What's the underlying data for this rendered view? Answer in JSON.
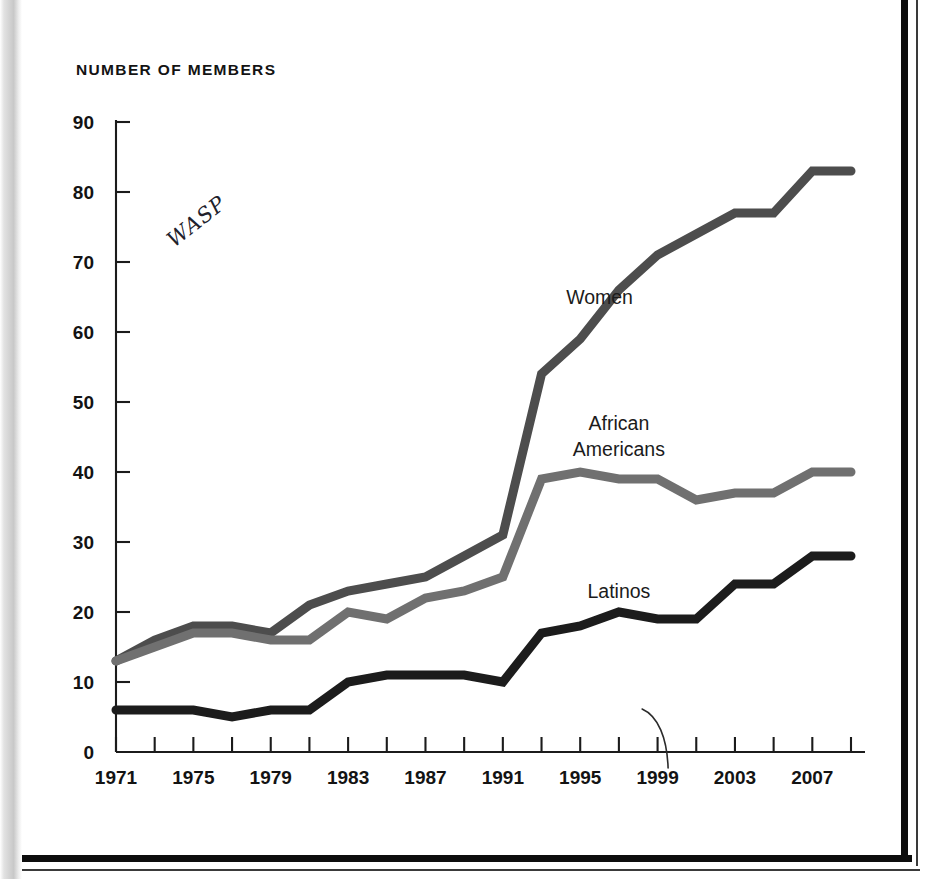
{
  "chart_data": {
    "type": "line",
    "title": "NUMBER OF MEMBERS",
    "xlabel": "",
    "ylabel": "",
    "xlim": [
      1971,
      2009
    ],
    "ylim": [
      0,
      90
    ],
    "grid": false,
    "legend_position": "inline-labels",
    "y_ticks": [
      0,
      10,
      20,
      30,
      40,
      50,
      60,
      70,
      80,
      90
    ],
    "y_tick_labels": [
      "0",
      "10",
      "20",
      "30",
      "40",
      "50",
      "60",
      "70",
      "80",
      "90"
    ],
    "x_ticks": [
      1971,
      1973,
      1975,
      1977,
      1979,
      1981,
      1983,
      1985,
      1987,
      1989,
      1991,
      1993,
      1995,
      1997,
      1999,
      2001,
      2003,
      2005,
      2007,
      2009
    ],
    "x_tick_labels_shown": [
      "1971",
      "1975",
      "1979",
      "1983",
      "1987",
      "1991",
      "1995",
      "1999",
      "2003",
      "2007"
    ],
    "x_labeled_years": [
      1971,
      1975,
      1979,
      1983,
      1987,
      1991,
      1995,
      1999,
      2003,
      2007
    ],
    "x": [
      1971,
      1973,
      1975,
      1977,
      1979,
      1981,
      1983,
      1985,
      1987,
      1989,
      1991,
      1993,
      1995,
      1997,
      1999,
      2001,
      2003,
      2005,
      2007,
      2009
    ],
    "series": [
      {
        "name": "Women",
        "color": "#4d4d4d",
        "stroke_width": 9,
        "values": [
          13,
          16,
          18,
          18,
          17,
          21,
          23,
          24,
          25,
          28,
          31,
          54,
          59,
          66,
          71,
          74,
          77,
          77,
          83,
          83
        ]
      },
      {
        "name": "African Americans",
        "color": "#707070",
        "stroke_width": 9,
        "values": [
          13,
          15,
          17,
          17,
          16,
          16,
          20,
          19,
          22,
          23,
          25,
          39,
          40,
          39,
          39,
          36,
          37,
          37,
          40,
          40
        ]
      },
      {
        "name": "Latinos",
        "color": "#1c1c1c",
        "stroke_width": 9,
        "values": [
          6,
          6,
          6,
          5,
          6,
          6,
          10,
          11,
          11,
          11,
          10,
          17,
          18,
          20,
          19,
          19,
          24,
          24,
          28,
          28
        ]
      }
    ],
    "annotations": [
      {
        "text": "Women",
        "x": 1996,
        "y": 64,
        "kind": "series-label"
      },
      {
        "text": "African\nAmericans",
        "x": 1997,
        "y": 46,
        "kind": "series-label"
      },
      {
        "text": "Latinos",
        "x": 1997,
        "y": 22,
        "kind": "series-label"
      },
      {
        "text": "WASP",
        "kind": "handwritten-note",
        "x": 1974,
        "y": 72
      }
    ]
  },
  "chart": {
    "title": "NUMBER OF MEMBERS",
    "y_labels": [
      "90",
      "80",
      "70",
      "60",
      "50",
      "40",
      "30",
      "20",
      "10",
      "0"
    ],
    "x_labels": [
      "1971",
      "1975",
      "1979",
      "1983",
      "1987",
      "1991",
      "1995",
      "1999",
      "2003",
      "2007"
    ],
    "series_labels": {
      "women": "Women",
      "african_americans_line1": "African",
      "african_americans_line2": "Americans",
      "latinos": "Latinos"
    },
    "handwritten_note": "WASP"
  }
}
